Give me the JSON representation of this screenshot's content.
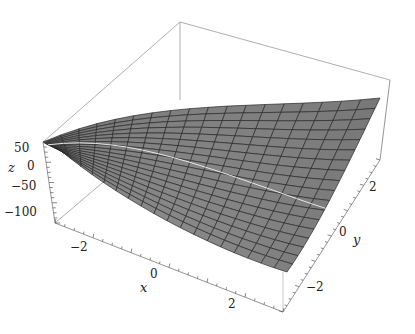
{
  "chart_data": {
    "type": "surface3d",
    "title": "",
    "xlabel": "x",
    "ylabel": "y",
    "zlabel": "z",
    "x_ticks": [
      "-2",
      "0",
      "2"
    ],
    "y_ticks": [
      "-2",
      "0",
      "2"
    ],
    "z_ticks": [
      "50",
      "0",
      "-50",
      "-100"
    ],
    "xlim": [
      -3,
      3
    ],
    "ylim": [
      -3,
      3
    ],
    "zlim": [
      -120,
      70
    ],
    "grid_mesh": "18x18",
    "surface_color": "#7d7d7d",
    "mesh_color": "#2a2a2a",
    "box": true
  },
  "axes": {
    "x": {
      "label": "x",
      "ticks": [
        {
          "text": "-2",
          "x": 52,
          "y": 262
        },
        {
          "text": "0",
          "x": 152,
          "y": 277
        },
        {
          "text": "2",
          "x": 230,
          "y": 307
        }
      ]
    },
    "y": {
      "label": "y",
      "ticks": [
        {
          "text": "-2",
          "x": 318,
          "y": 292
        },
        {
          "text": "0",
          "x": 340,
          "y": 240
        },
        {
          "text": "2",
          "x": 372,
          "y": 192
        }
      ]
    },
    "z": {
      "label": "z",
      "ticks": [
        {
          "text": "50",
          "x": 14,
          "y": 152
        },
        {
          "text": "0",
          "x": 26,
          "y": 168
        },
        {
          "text": "-50",
          "x": 14,
          "y": 190
        },
        {
          "text": "-100",
          "x": 8,
          "y": 215
        }
      ]
    }
  }
}
